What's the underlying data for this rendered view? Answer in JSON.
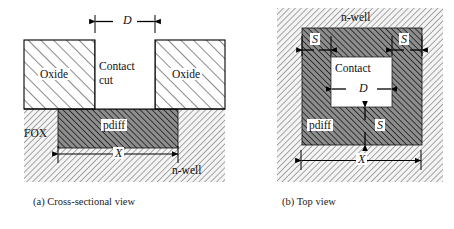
{
  "figure": {
    "panels": [
      {
        "id": "a",
        "caption": "(a)  Cross-sectional view",
        "labels": {
          "oxide_left": "Oxide",
          "oxide_right": "Oxide",
          "contact_line1": "Contact",
          "contact_line2": "cut",
          "pdiff": "pdiff",
          "fox": "FOX",
          "nwell": "n-well",
          "dim_d": "D",
          "dim_x": "X"
        }
      },
      {
        "id": "b",
        "caption": "(b) Top view",
        "labels": {
          "nwell": "n-well",
          "pdiff": "pdiff",
          "contact": "Contact",
          "dim_d": "D",
          "dim_x": "X",
          "dim_s_left": "S",
          "dim_s_right": "S",
          "dim_s_bottom": "S"
        }
      }
    ],
    "colors": {
      "line": "#000000",
      "oxide_hatch": "#2b2b2b",
      "pdiff_fill": "#8a8a8a",
      "pdiff_hatch": "#161616",
      "nwell_fill": "#f2f2f2",
      "nwell_hatch": "#6e6e6e",
      "background": "#ffffff",
      "caption": "#1a1a1a"
    }
  }
}
